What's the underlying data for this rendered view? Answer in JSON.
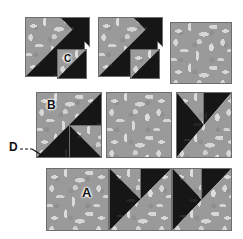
{
  "figure": {
    "type": "quilt-block-diagram",
    "background_color": "#ffffff",
    "fabric_print_color": "#9a9a9a",
    "fabric_motif_color": "#d8d8d8",
    "fabric_dark_color": "#161616",
    "seam_line_color": "#6e6e6e"
  },
  "labels": [
    {
      "id": "A",
      "text": "A",
      "x": 82,
      "y": 186,
      "size": 12
    },
    {
      "id": "B",
      "text": "B",
      "x": 47,
      "y": 100,
      "size": 11
    },
    {
      "id": "C",
      "text": "C",
      "x": 65,
      "y": 55,
      "size": 10
    },
    {
      "id": "D",
      "text": "D",
      "x": 10,
      "y": 143,
      "size": 11
    }
  ],
  "leader_lines": [
    {
      "id": "D-leader",
      "from": "D",
      "style": "dashed",
      "points": "22,148 33,148 42,153"
    }
  ],
  "rows": [
    {
      "name": "row-1",
      "pieces": [
        {
          "name": "large-half-square-triangle-left",
          "shape": "square-split-diagonal",
          "upper": "print",
          "lower": "dark"
        },
        {
          "name": "small-dark-triangle-upper-right",
          "shape": "triangle",
          "fill": "dark"
        },
        {
          "name": "small-square-C",
          "shape": "square-split-diagonal",
          "upper": "print",
          "lower": "dark",
          "label": "C"
        },
        {
          "name": "large-half-square-triangle-middle",
          "shape": "square-split-diagonal",
          "upper": "print",
          "lower": "dark"
        },
        {
          "name": "small-dark-triangle-middle-right",
          "shape": "triangle",
          "fill": "dark"
        },
        {
          "name": "small-square-middle",
          "shape": "square-split-diagonal",
          "upper": "print",
          "lower": "dark"
        },
        {
          "name": "solid-print-square-right",
          "shape": "square",
          "fill": "print"
        }
      ]
    },
    {
      "name": "row-2",
      "pieces": [
        {
          "name": "block-B",
          "shape": "square-split-diagonal-with-inset",
          "upper": "print",
          "lower": "dark",
          "inset": "print-square-bottom-right",
          "label": "B"
        },
        {
          "name": "solid-print-square-center",
          "shape": "square",
          "fill": "print"
        },
        {
          "name": "block-right",
          "shape": "square-split-diagonal-with-inset",
          "upper": "dark",
          "lower": "print",
          "inset": "print-triangle-top-left"
        }
      ]
    },
    {
      "name": "row-3",
      "pieces": [
        {
          "name": "block-A-solid-print",
          "shape": "square",
          "fill": "print",
          "label": "A"
        },
        {
          "name": "block-A-middle",
          "shape": "square-split-diagonal-with-inset",
          "upper": "dark",
          "lower": "print",
          "inset": "print-triangle-top-left"
        },
        {
          "name": "block-A-right",
          "shape": "square-split-diagonal-with-inset",
          "upper": "dark",
          "lower": "print",
          "inset": "print-triangle-top-left"
        }
      ]
    }
  ]
}
